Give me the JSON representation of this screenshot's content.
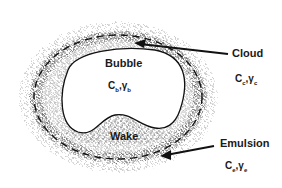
{
  "diagram": {
    "regions": [
      {
        "id": "bubble",
        "label": "Bubble",
        "symbol": "Cb, γb",
        "sym_main": "C",
        "sym_sub": "b",
        "sym2_main": "γ",
        "sym2_sub": "b"
      },
      {
        "id": "wake",
        "label": "Wake"
      },
      {
        "id": "cloud",
        "label": "Cloud",
        "symbol": "Cc, γc",
        "sym_main": "C",
        "sym_sub": "c",
        "sym2_main": "γ",
        "sym2_sub": "c"
      },
      {
        "id": "emulsion",
        "label": "Emulsion",
        "symbol": "Ce, γe",
        "sym_main": "C",
        "sym_sub": "e",
        "sym2_main": "γ",
        "sym2_sub": "e"
      }
    ],
    "colors": {
      "ink": "#1a1a1a",
      "background": "#ffffff",
      "bubble_fill": "#ffffff"
    }
  }
}
